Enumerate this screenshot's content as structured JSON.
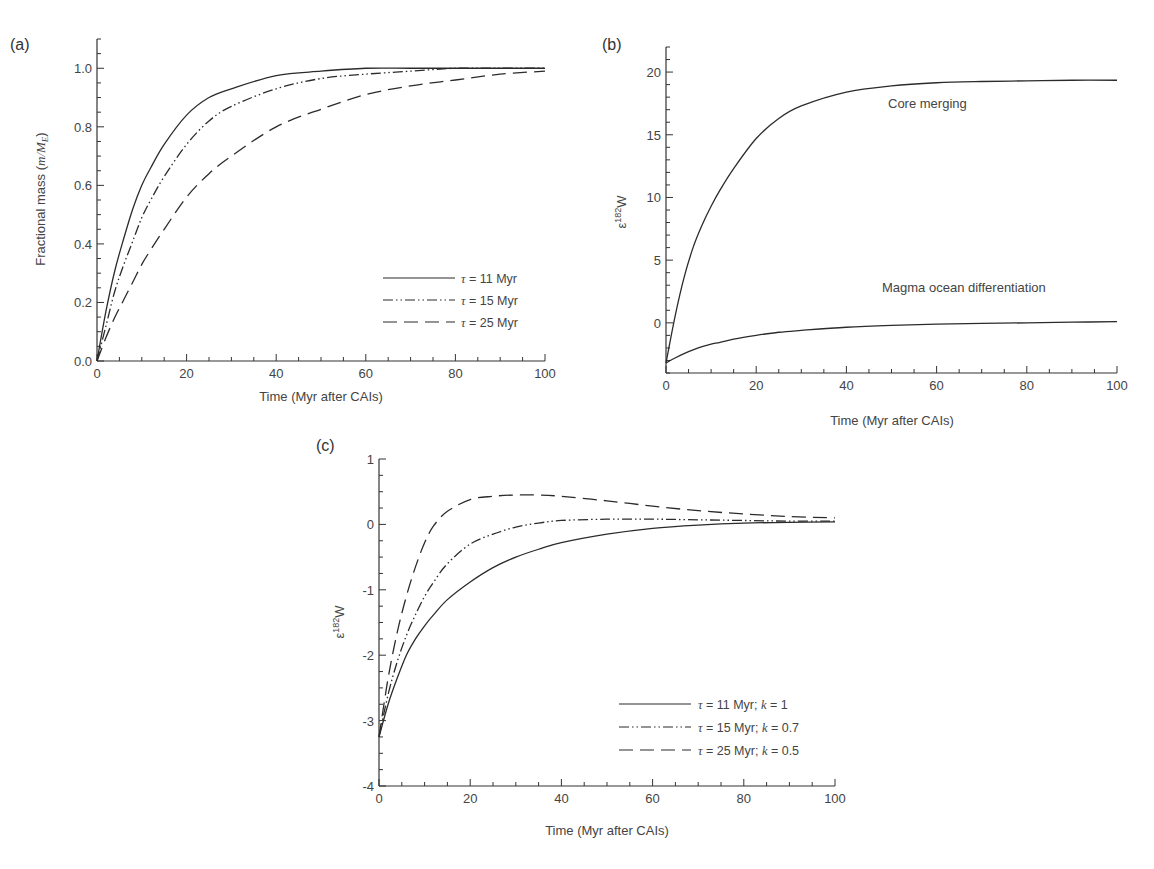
{
  "chart_data": [
    {
      "panel": "(a)",
      "type": "line",
      "title": "",
      "xlabel": "Time (Myr after CAIs)",
      "ylabel": "Fractional mass (m/M_E)",
      "ylabel_prefix": "Fractional mass (",
      "ylabel_math": "m/M",
      "ylabel_sub": "E",
      "ylabel_suffix": ")",
      "xlim": [
        0,
        100
      ],
      "ylim": [
        0.0,
        1.1
      ],
      "xticks": [
        0,
        20,
        40,
        60,
        80,
        100
      ],
      "xtick_labels": [
        "0",
        "20",
        "40",
        "60",
        "80",
        "100"
      ],
      "yticks": [
        0.0,
        0.2,
        0.4,
        0.6,
        0.8,
        1.0
      ],
      "ytick_labels": [
        "0.0",
        "0.2",
        "0.4",
        "0.6",
        "0.8",
        "1.0"
      ],
      "grid": false,
      "legend_position": "lower right",
      "x": [
        0,
        2,
        4,
        6,
        8,
        10,
        12,
        15,
        20,
        25,
        30,
        40,
        50,
        60,
        70,
        80,
        90,
        100
      ],
      "series": [
        {
          "name": "τ = 11 Myr",
          "style": "solid",
          "values": [
            0,
            0.17,
            0.31,
            0.42,
            0.52,
            0.6,
            0.66,
            0.74,
            0.84,
            0.9,
            0.93,
            0.975,
            0.99,
            1.0,
            1.0,
            1.0,
            1.0,
            1.0
          ]
        },
        {
          "name": "τ = 15 Myr",
          "style": "dash-dot-dot",
          "values": [
            0,
            0.12,
            0.24,
            0.33,
            0.41,
            0.49,
            0.55,
            0.63,
            0.74,
            0.82,
            0.87,
            0.93,
            0.965,
            0.98,
            0.99,
            1.0,
            1.0,
            1.0
          ]
        },
        {
          "name": "τ = 25 Myr",
          "style": "dashed",
          "values": [
            0,
            0.08,
            0.15,
            0.21,
            0.27,
            0.33,
            0.38,
            0.45,
            0.56,
            0.64,
            0.7,
            0.8,
            0.86,
            0.91,
            0.94,
            0.96,
            0.98,
            0.99
          ]
        }
      ],
      "legend": [
        {
          "symbol": "τ",
          "label": " = 11 Myr"
        },
        {
          "symbol": "τ",
          "label": " = 15 Myr"
        },
        {
          "symbol": "τ",
          "label": " = 25 Myr"
        }
      ]
    },
    {
      "panel": "(b)",
      "type": "line",
      "title": "",
      "xlabel": "Time (Myr after CAIs)",
      "ylabel": "ε182W",
      "ylabel_eps": "ε",
      "ylabel_sup": "182",
      "ylabel_el": "W",
      "xlim": [
        0,
        100
      ],
      "ylim": [
        -4,
        22
      ],
      "xticks": [
        0,
        20,
        40,
        60,
        80,
        100
      ],
      "xtick_labels": [
        "0",
        "20",
        "40",
        "60",
        "80",
        "100"
      ],
      "yticks": [
        0,
        5,
        10,
        15,
        20
      ],
      "ytick_labels": [
        "0",
        "5",
        "10",
        "15",
        "20"
      ],
      "grid": false,
      "x": [
        0,
        2,
        4,
        6,
        8,
        10,
        12,
        15,
        20,
        25,
        30,
        40,
        50,
        60,
        70,
        80,
        90,
        100
      ],
      "series": [
        {
          "name": "Core merging",
          "style": "solid",
          "values": [
            -3.2,
            0.5,
            3.6,
            6.0,
            7.8,
            9.3,
            10.6,
            12.3,
            14.7,
            16.3,
            17.3,
            18.4,
            18.9,
            19.15,
            19.25,
            19.3,
            19.35,
            19.35
          ]
        },
        {
          "name": "Magma ocean differentiation",
          "style": "solid",
          "values": [
            -3.2,
            -2.8,
            -2.45,
            -2.15,
            -1.9,
            -1.7,
            -1.55,
            -1.3,
            -1.0,
            -0.75,
            -0.6,
            -0.35,
            -0.2,
            -0.1,
            -0.05,
            0.0,
            0.05,
            0.1
          ]
        }
      ],
      "annotations": [
        {
          "text": "Core merging",
          "x": 70,
          "y": 17.2
        },
        {
          "text": "Magma ocean differentiation",
          "x": 66,
          "y": 2.8
        }
      ]
    },
    {
      "panel": "(c)",
      "type": "line",
      "title": "",
      "xlabel": "Time (Myr after CAIs)",
      "ylabel": "ε182W",
      "ylabel_eps": "ε",
      "ylabel_sup": "182",
      "ylabel_el": "W",
      "xlim": [
        0,
        100
      ],
      "ylim": [
        -4,
        1
      ],
      "xticks": [
        0,
        20,
        40,
        60,
        80,
        100
      ],
      "xtick_labels": [
        "0",
        "20",
        "40",
        "60",
        "80",
        "100"
      ],
      "yticks": [
        -4,
        -3,
        -2,
        -1,
        0,
        1
      ],
      "ytick_labels": [
        "-4",
        "-3",
        "-2",
        "-1",
        "0",
        "1"
      ],
      "grid": false,
      "legend_position": "lower right",
      "x": [
        0,
        2,
        4,
        6,
        8,
        10,
        12,
        15,
        20,
        25,
        30,
        35,
        40,
        50,
        60,
        70,
        80,
        90,
        100
      ],
      "series": [
        {
          "name": "τ = 11 Myr; k = 1",
          "style": "solid",
          "values": [
            -3.25,
            -2.75,
            -2.35,
            -2.0,
            -1.75,
            -1.55,
            -1.38,
            -1.15,
            -0.88,
            -0.66,
            -0.5,
            -0.38,
            -0.28,
            -0.15,
            -0.06,
            -0.01,
            0.02,
            0.03,
            0.04
          ]
        },
        {
          "name": "τ = 15 Myr; k = 0.7",
          "style": "dash-dot-dot",
          "values": [
            -3.25,
            -2.6,
            -2.1,
            -1.7,
            -1.38,
            -1.1,
            -0.88,
            -0.6,
            -0.3,
            -0.15,
            -0.04,
            0.02,
            0.06,
            0.08,
            0.08,
            0.07,
            0.06,
            0.05,
            0.05
          ]
        },
        {
          "name": "τ = 25 Myr; k = 0.5",
          "style": "dashed",
          "values": [
            -3.25,
            -2.35,
            -1.65,
            -1.1,
            -0.65,
            -0.28,
            -0.02,
            0.2,
            0.38,
            0.43,
            0.45,
            0.45,
            0.43,
            0.36,
            0.28,
            0.21,
            0.16,
            0.12,
            0.1
          ]
        }
      ],
      "legend": [
        {
          "symbol": "τ",
          "label": " = 11 Myr; ",
          "k": "k",
          "k_val": " = 1"
        },
        {
          "symbol": "τ",
          "label": " = 15 Myr; ",
          "k": "k",
          "k_val": " = 0.7"
        },
        {
          "symbol": "τ",
          "label": " = 25 Myr; ",
          "k": "k",
          "k_val": " = 0.5"
        }
      ]
    }
  ],
  "colors": {
    "line": "#2b2b2b",
    "axis": "#333333",
    "text": "#444444",
    "background": "#ffffff"
  }
}
